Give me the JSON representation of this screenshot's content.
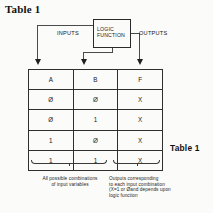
{
  "document": {
    "heading": "Table 1"
  },
  "diagram": {
    "block_label": "LOGIC\nFUNCTION",
    "inputs_label": "INPUTS",
    "outputs_label": "OUTPUTS"
  },
  "truth_table": {
    "headers": [
      "A",
      "B",
      "F"
    ],
    "rows": [
      [
        "Ø",
        "Ø",
        "X"
      ],
      [
        "Ø",
        "1",
        "X"
      ],
      [
        "1",
        "Ø",
        "X"
      ],
      [
        "1",
        "1",
        "X"
      ]
    ]
  },
  "caption": {
    "table_label": "Table 1"
  },
  "annotations": {
    "inputs_note": "All possible combinations\nof input variables",
    "outputs_note": "Outputs corresponding\nto each input combination\n(X=1 or Øand depends upon\nlogic function"
  }
}
